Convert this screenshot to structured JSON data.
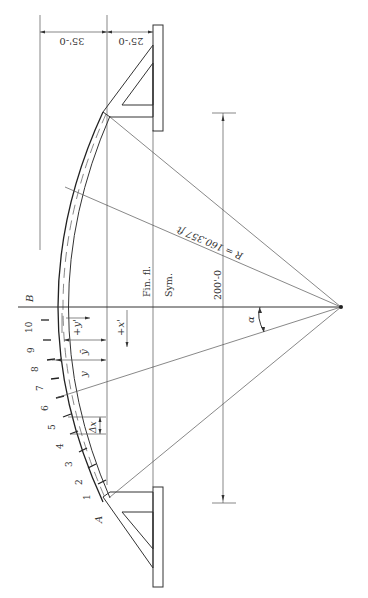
{
  "diagram": {
    "type": "circular arch roof section (rotated)",
    "labels": {
      "dim_top_right": "25'-0",
      "dim_top_left": "35'-0",
      "radius": "R = 160.357 ft",
      "fin_floor": "Fin. fl.",
      "symmetry": "Sym.",
      "span": "200'-0",
      "alpha": "α",
      "crown": "B",
      "springing": "A",
      "y": "y",
      "y_bar": "ȳ",
      "y_prime": "+y'",
      "x_prime": "+x'",
      "delta_x": "Δx"
    },
    "segment_numbers": [
      "1",
      "2",
      "3",
      "4",
      "5",
      "6",
      "7",
      "8",
      "9",
      "10"
    ],
    "colors": {
      "line": "#333333",
      "background": "#ffffff"
    }
  }
}
